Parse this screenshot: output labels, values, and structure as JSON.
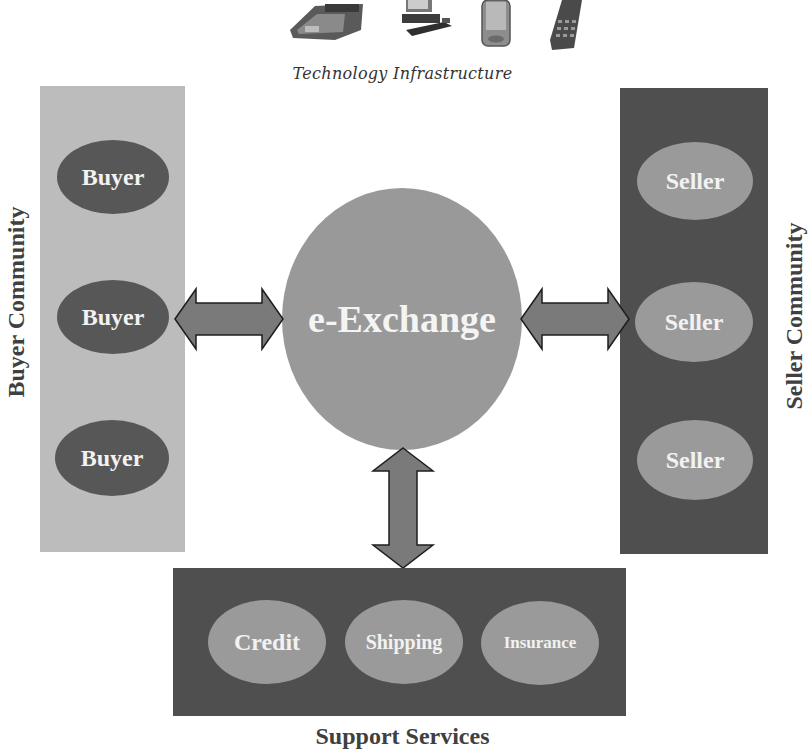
{
  "header": {
    "devices": [
      "fax-machine",
      "desktop-computer",
      "pda",
      "mobile-phone"
    ],
    "label": "Technology Infrastructure"
  },
  "buyer_community": {
    "label": "Buyer Community",
    "items": [
      {
        "label": "Buyer"
      },
      {
        "label": "Buyer"
      },
      {
        "label": "Buyer"
      }
    ]
  },
  "hub": {
    "label": "e-Exchange"
  },
  "seller_community": {
    "label": "Seller Community",
    "items": [
      {
        "label": "Seller"
      },
      {
        "label": "Seller"
      },
      {
        "label": "Seller"
      }
    ]
  },
  "support_services": {
    "label": "Support Services",
    "items": [
      {
        "label": "Credit"
      },
      {
        "label": "Shipping"
      },
      {
        "label": "Insurance"
      }
    ]
  },
  "colors": {
    "buyer_panel": "#bcbcbc",
    "buyer_oval": "#575757",
    "seller_panel": "#4f4f4f",
    "seller_oval": "#9a9a9a",
    "hub": "#999999",
    "arrow": "#7a7a7a"
  }
}
